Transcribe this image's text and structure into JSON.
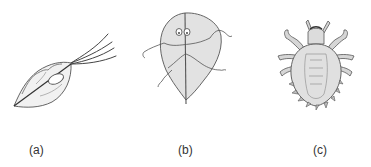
{
  "figures": [
    {
      "id": "a",
      "label": "(a)",
      "subject": "flagellated protozoan (trichomonas-like)"
    },
    {
      "id": "b",
      "label": "(b)",
      "subject": "flagellated protozoan (giardia-like)"
    },
    {
      "id": "c",
      "label": "(c)",
      "subject": "louse"
    }
  ],
  "colors": {
    "outline": "#555555",
    "fill": "#e2e2e2",
    "fill_dark": "#cfcfcf",
    "label": "#333333"
  }
}
